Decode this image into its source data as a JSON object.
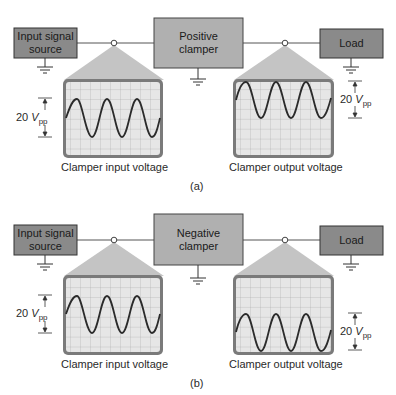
{
  "colors": {
    "box_dark": "#8a8a8a",
    "box_light": "#b0b0b0",
    "beam": "#c4c4c4",
    "scope_bezel": "#7a7a7a",
    "scope_screen": "#e6e6e6",
    "grid": "#a8a8a8",
    "trace": "#2b2b2b"
  },
  "panel_a": {
    "source_label_1": "Input signal",
    "source_label_2": "source",
    "clamper_label_1": "Positive",
    "clamper_label_2": "clamper",
    "load_label": "Load",
    "input_amp": "20",
    "input_unit": "V",
    "input_sub": "pp",
    "output_amp": "20",
    "output_unit": "V",
    "output_sub": "pp",
    "input_caption": "Clamper input voltage",
    "output_caption": "Clamper output voltage",
    "tag": "(a)"
  },
  "panel_b": {
    "source_label_1": "Input signal",
    "source_label_2": "source",
    "clamper_label_1": "Negative",
    "clamper_label_2": "clamper",
    "load_label": "Load",
    "input_amp": "20",
    "input_unit": "V",
    "input_sub": "pp",
    "output_amp": "20",
    "output_unit": "V",
    "output_sub": "pp",
    "input_caption": "Clamper input voltage",
    "output_caption": "Clamper output voltage",
    "tag": "(b)"
  }
}
